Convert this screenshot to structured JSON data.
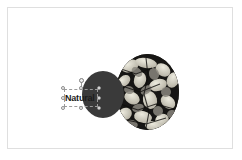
{
  "app": {
    "surface": "slide-canvas",
    "background_color": "#ffffff",
    "canvas_border_color": "#dfdfdf"
  },
  "slide": {
    "objects": [
      {
        "id": "photo-circle",
        "type": "image-shape",
        "shape": "circle",
        "semantic_name": "foliage-photo-circle",
        "description": "Circular cropped photograph of overlapping leaves and foliage in high contrast black and white",
        "selected": false,
        "colors": {
          "dark": "#171613",
          "mid": "#8d8a82",
          "light": "#e9e6de"
        }
      },
      {
        "id": "accent-circle",
        "type": "shape",
        "shape": "circle",
        "semantic_name": "dark-accent-circle",
        "fill_color": "#3a3a3a",
        "selected": false
      },
      {
        "id": "text-object",
        "type": "text",
        "semantic_name": "natural-text-box",
        "text": "Natural",
        "text_color": "#1a1a1a",
        "bold": true,
        "selected": true
      }
    ]
  },
  "selection": {
    "target": "Natural",
    "outline_color": "#9a9a9a",
    "handle_fill": "#f2f2f2",
    "handle_stroke": "#8d8d8d",
    "handles": [
      "top-left",
      "top-center",
      "top-right",
      "middle-left",
      "middle-right",
      "bottom-left",
      "bottom-center",
      "bottom-right"
    ],
    "rotate_handle": "rotate"
  }
}
